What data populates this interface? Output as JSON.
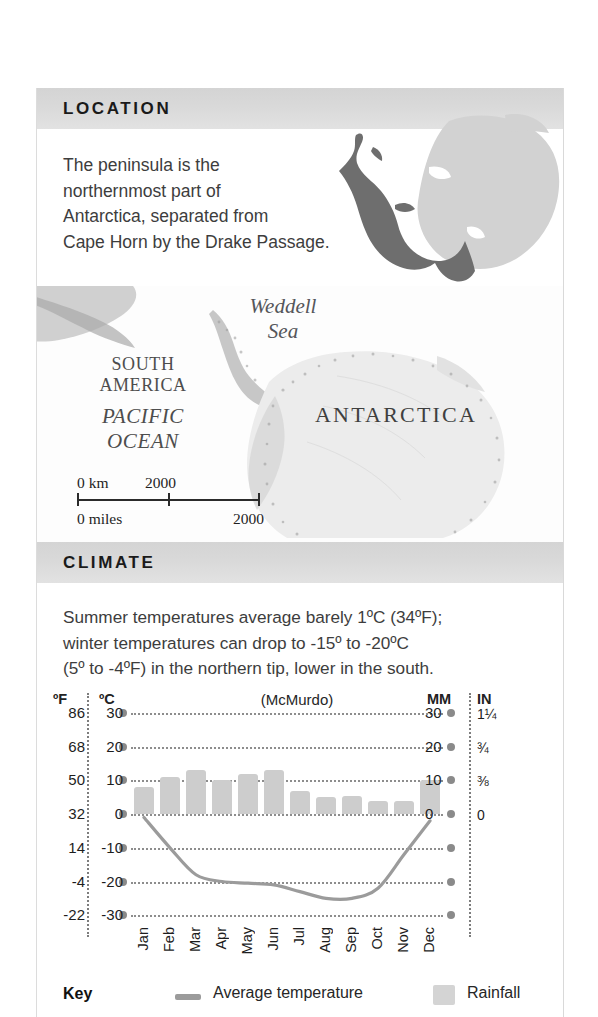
{
  "location": {
    "heading": "LOCATION",
    "body": "The peninsula is the\nnorthernmost part of\nAntarctica, separated from\nCape Horn by the Drake Passage."
  },
  "map": {
    "labels": {
      "weddell_sea": "Weddell\nSea",
      "south_america": "SOUTH\nAMERICA",
      "pacific_ocean": "PACIFIC\nOCEAN",
      "antarctica": "ANTARCTICA"
    },
    "scale": {
      "km_start": "0 km",
      "km_end": "2000",
      "miles_start": "0 miles",
      "miles_end": "2000"
    }
  },
  "climate": {
    "heading": "CLIMATE",
    "body": "Summer temperatures average barely 1ºC (34ºF);\nwinter temperatures can drop to -15º to -20ºC\n(5º to -4ºF) in the northern tip, lower in the south."
  },
  "chart_axes": {
    "fahrenheit_header": "ºF",
    "celsius_header": "ºC",
    "mm_header": "MM",
    "in_header": "IN",
    "station": "(McMurdo)"
  },
  "key": {
    "label": "Key",
    "temperature": "Average temperature",
    "rainfall": "Rainfall"
  },
  "colors": {
    "bar": "#cdcdcd",
    "line": "#9b9b9b",
    "grid": "#8d8d8d",
    "header_bar": "#d9d9d9",
    "text": "#3d3d3d"
  },
  "chart_data": {
    "type": "bar",
    "title": "(McMurdo)",
    "xlabel": "",
    "ylabel": "Temperature / Rainfall",
    "categories": [
      "Jan",
      "Feb",
      "Mar",
      "Apr",
      "May",
      "Jun",
      "Jul",
      "Aug",
      "Sep",
      "Oct",
      "Nov",
      "Dec"
    ],
    "grid": true,
    "legend_position": "bottom",
    "axes": {
      "left_celsius": {
        "label": "ºC",
        "ticks": [
          30,
          20,
          10,
          0,
          -10,
          -20,
          -30
        ],
        "range": [
          -30,
          30
        ]
      },
      "left_fahrenheit": {
        "label": "ºF",
        "ticks": [
          "86",
          "68",
          "50",
          "32",
          "14",
          "-4",
          "-22"
        ],
        "range": [
          -22,
          86
        ]
      },
      "right_mm": {
        "label": "MM",
        "ticks": [
          "30",
          "20",
          "10",
          "0",
          "",
          "",
          ""
        ],
        "range": [
          0,
          30
        ]
      },
      "right_inches": {
        "label": "IN",
        "ticks": [
          "1¼",
          "¾",
          "⅜",
          "0",
          "",
          "",
          ""
        ],
        "range": [
          0,
          1.25
        ]
      }
    },
    "series": [
      {
        "name": "Average temperature",
        "type": "line",
        "unit": "ºC",
        "axis": "left_celsius",
        "color": "#9b9b9b",
        "values": [
          -1,
          -10,
          -18,
          -20,
          -20.5,
          -21,
          -23,
          -25,
          -25,
          -22,
          -12,
          -2
        ]
      },
      {
        "name": "Rainfall",
        "type": "bar",
        "unit": "mm",
        "axis": "right_mm",
        "color": "#cdcdcd",
        "values": [
          8,
          11,
          13,
          10,
          12,
          13,
          7,
          5,
          5.5,
          4,
          4,
          10
        ]
      }
    ]
  }
}
